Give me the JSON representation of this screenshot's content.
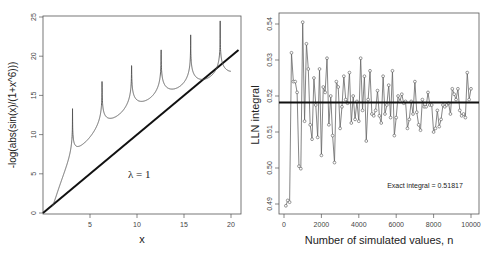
{
  "chart_data": [
    {
      "type": "line",
      "title": "",
      "xlabel": "x",
      "ylabel": "-log(abs(sin(x)/(1+x^6)))",
      "xlim": [
        0,
        20.8
      ],
      "ylim": [
        0,
        25
      ],
      "xticks": [
        "5",
        "10",
        "15",
        "20"
      ],
      "yticks": [
        "0",
        "5",
        "10",
        "15",
        "20",
        "25"
      ],
      "grid": false,
      "annotations": [
        "λ = 1"
      ],
      "series": [
        {
          "name": "-log(abs(sin(x)/(1+x^6)))",
          "function": "-log(abs(sin(x)/(1+x^6)))",
          "x_range": [
            1,
            20
          ],
          "color": "#555555"
        },
        {
          "name": "lambda*x",
          "function": "x",
          "slope": 1,
          "x_range": [
            0,
            20.8
          ],
          "color": "#111111"
        }
      ]
    },
    {
      "type": "scatter",
      "title": "",
      "xlabel": "Number of simulated values, n",
      "ylabel": "LLN integral",
      "xlim": [
        0,
        10000
      ],
      "ylim": [
        0.489,
        0.542
      ],
      "xticks": [
        "0",
        "2000",
        "4000",
        "6000",
        "8000",
        "10000"
      ],
      "yticks": [
        "0.49",
        "0.50",
        "0.51",
        "0.52",
        "0.53",
        "0.54"
      ],
      "grid": false,
      "annotations": [
        "Exact integral = 0.51817"
      ],
      "hline": 0.51817,
      "series": [
        {
          "name": "LLN estimate",
          "connected": true,
          "x": [
            100,
            200,
            300,
            400,
            500,
            600,
            700,
            800,
            900,
            1000,
            1100,
            1200,
            1300,
            1400,
            1500,
            1600,
            1700,
            1800,
            1900,
            2000,
            2100,
            2200,
            2300,
            2400,
            2500,
            2600,
            2700,
            2800,
            2900,
            3000,
            3100,
            3200,
            3300,
            3400,
            3500,
            3600,
            3700,
            3800,
            3900,
            4000,
            4100,
            4200,
            4300,
            4400,
            4500,
            4600,
            4700,
            4800,
            4900,
            5000,
            5100,
            5200,
            5300,
            5400,
            5500,
            5600,
            5700,
            5800,
            5900,
            6000,
            6100,
            6200,
            6300,
            6400,
            6500,
            6600,
            6700,
            6800,
            6900,
            7000,
            7100,
            7200,
            7300,
            7400,
            7500,
            7600,
            7700,
            7800,
            7900,
            8000,
            8100,
            8200,
            8300,
            8400,
            8500,
            8600,
            8700,
            8800,
            8900,
            9000,
            9100,
            9200,
            9300,
            9400,
            9500,
            9600,
            9700,
            9800,
            9900,
            10000
          ],
          "values": [
            0.4895,
            0.491,
            0.4905,
            0.532,
            0.524,
            0.524,
            0.521,
            0.5005,
            0.4998,
            0.5405,
            0.513,
            0.5345,
            0.5275,
            0.512,
            0.508,
            0.525,
            0.5175,
            0.5085,
            0.5275,
            0.5035,
            0.5225,
            0.521,
            0.5305,
            0.512,
            0.52,
            0.509,
            0.5015,
            0.524,
            0.5225,
            0.511,
            0.517,
            0.5255,
            0.519,
            0.518,
            0.5265,
            0.5125,
            0.52,
            0.5135,
            0.5185,
            0.513,
            0.5305,
            0.516,
            0.5255,
            0.5075,
            0.519,
            0.527,
            0.515,
            0.5145,
            0.516,
            0.5215,
            0.5145,
            0.5125,
            0.5255,
            0.515,
            0.5175,
            0.523,
            0.514,
            0.527,
            0.509,
            0.514,
            0.52,
            0.5185,
            0.5205,
            0.518,
            0.5185,
            0.511,
            0.5135,
            0.5185,
            0.515,
            0.524,
            0.5155,
            0.512,
            0.5105,
            0.519,
            0.517,
            0.517,
            0.521,
            0.5175,
            0.5175,
            0.51,
            0.511,
            0.516,
            0.5115,
            0.5135,
            0.5175,
            0.517,
            0.5175,
            0.518,
            0.515,
            0.522,
            0.5205,
            0.519,
            0.522,
            0.516,
            0.5145,
            0.515,
            0.514,
            0.5265,
            0.519,
            0.522
          ]
        }
      ]
    }
  ]
}
